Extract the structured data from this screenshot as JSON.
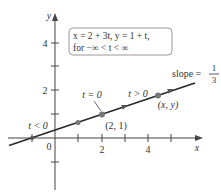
{
  "figure": {
    "equation_box": {
      "line1": "x = 2 + 3t, y = 1 + t,",
      "line2": "for −∞ < t < ∞"
    },
    "axes": {
      "x_label": "x",
      "y_label": "y",
      "origin_label": "0",
      "x_ticks": [
        {
          "value": -1,
          "label": ""
        },
        {
          "value": 1,
          "label": ""
        },
        {
          "value": 2,
          "label": "2"
        },
        {
          "value": 3,
          "label": ""
        },
        {
          "value": 4,
          "label": "4"
        },
        {
          "value": 5,
          "label": ""
        }
      ],
      "y_ticks": [
        {
          "value": -1,
          "label": ""
        },
        {
          "value": 1,
          "label": ""
        },
        {
          "value": 2,
          "label": "2"
        },
        {
          "value": 3,
          "label": ""
        },
        {
          "value": 4,
          "label": "4"
        }
      ]
    },
    "line": {
      "parametric_x": "2 + 3t",
      "parametric_y": "1 + t",
      "slope_label": "slope =",
      "slope_num": "1",
      "slope_den": "3"
    },
    "annotations": {
      "t_less": "t < 0",
      "t_zero": "t = 0",
      "t_greater": "t > 0",
      "point_21": "(2, 1)",
      "point_xy": "(x, y)"
    },
    "colors": {
      "line": "#2a2a2a",
      "point": "#777777",
      "box_border": "#999999",
      "text": "#333333"
    }
  }
}
